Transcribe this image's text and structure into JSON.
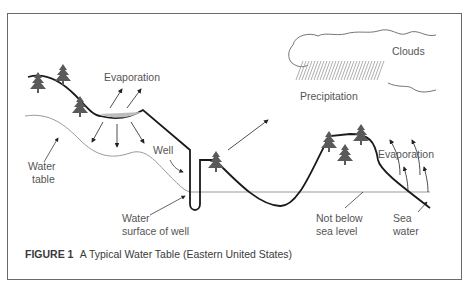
{
  "diagram": {
    "labels": {
      "evaporation_left": "Evaporation",
      "clouds": "Clouds",
      "precipitation": "Precipitation",
      "well": "Well",
      "water_table_line1": "Water",
      "water_table_line2": "table",
      "water_surface_line1": "Water",
      "water_surface_line2": "surface of well",
      "evaporation_right": "Evaporation",
      "not_below_line1": "Not below",
      "not_below_line2": "sea level",
      "sea_water_line1": "Sea",
      "sea_water_line2": "water"
    },
    "colors": {
      "ground_line": "#1a1a1a",
      "water_table_line": "#9a9a9a",
      "tree_fill": "#5a5a5a",
      "pond_fill": "#bdbdbd",
      "label_text": "#555555"
    }
  },
  "caption": {
    "figure_number": "FIGURE 1",
    "title": "A Typical Water Table (Eastern United States)"
  }
}
